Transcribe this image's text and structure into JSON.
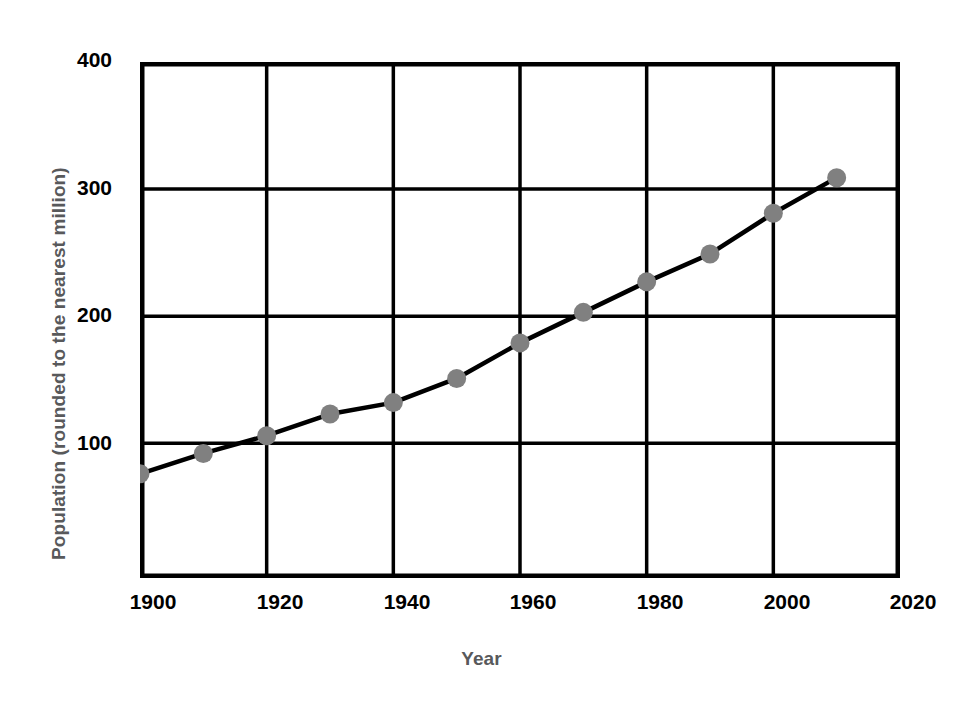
{
  "chart_data": {
    "type": "line",
    "title": "",
    "xlabel": "Year",
    "ylabel": "Population (rounded to the nearest million)",
    "x": [
      1900,
      1910,
      1920,
      1930,
      1940,
      1950,
      1960,
      1970,
      1980,
      1990,
      2000,
      2010
    ],
    "values": [
      76,
      92,
      106,
      123,
      132,
      151,
      179,
      203,
      227,
      249,
      281,
      309
    ],
    "series": [
      {
        "name": "Population",
        "values": [
          76,
          92,
          106,
          123,
          132,
          151,
          179,
          203,
          227,
          249,
          281,
          309
        ]
      }
    ],
    "xlim": [
      1900,
      2020
    ],
    "ylim": [
      -6,
      400
    ],
    "xticks": [
      1900,
      1920,
      1940,
      1960,
      1980,
      2000,
      2020
    ],
    "xtick_labels": [
      "1900",
      "1920",
      "1940",
      "1960",
      "1980",
      "2000",
      "2020"
    ],
    "yticks": [
      100,
      200,
      300,
      400
    ],
    "ytick_labels": [
      "100",
      "200",
      "300",
      "400"
    ],
    "grid": true,
    "legend": "none",
    "marker": "circle",
    "marker_color": "#808080",
    "line_color": "#000000",
    "grid_color": "#000000",
    "axis_title_color": "#58595b",
    "tick_label_color": "#000000",
    "background": "#ffffff"
  }
}
